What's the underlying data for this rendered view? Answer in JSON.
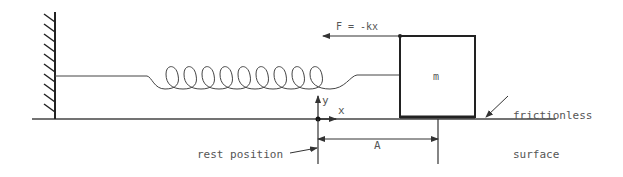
{
  "diagram": {
    "labels": {
      "force": "F = -kx",
      "mass": "m",
      "y_axis": "y",
      "x_axis": "x",
      "surface_line1": "frictionless",
      "surface_line2": "surface",
      "rest_position": "rest position",
      "amplitude": "A"
    },
    "elements": {
      "wall": "fixed wall with hatching",
      "spring": {
        "coils": 9
      },
      "block": "mass block m",
      "force_arrow": "points left (restoring force)",
      "axes": "origin at rest position",
      "dimension": "amplitude A from rest position to displaced block edge"
    },
    "colors": {
      "stroke": "#333333",
      "text": "#555555",
      "background": "#ffffff"
    }
  }
}
